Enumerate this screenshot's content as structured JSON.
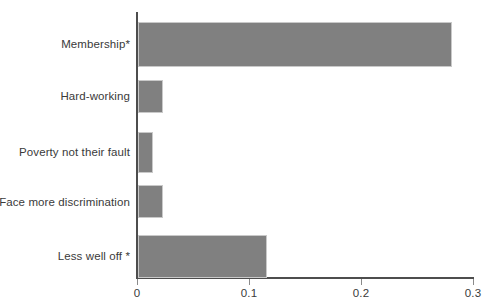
{
  "chart_data": {
    "type": "bar",
    "orientation": "horizontal",
    "title": "",
    "xlabel": "",
    "ylabel": "",
    "categories": [
      "Membership*",
      "Hard-working",
      "Poverty not their fault",
      "Face more discrimination",
      "Less well off *"
    ],
    "values": [
      0.28,
      0.022,
      0.013,
      0.022,
      0.115
    ],
    "xlim": [
      0,
      0.3
    ],
    "xticks": [
      0,
      0.1,
      0.2,
      0.3
    ],
    "xtick_labels": [
      "0",
      "0.1",
      "0.2",
      "0.3"
    ],
    "grid": false,
    "legend": null,
    "bar_color": "#808080",
    "axis_color": "#4d4d4d",
    "background_color": "#ffffff"
  }
}
